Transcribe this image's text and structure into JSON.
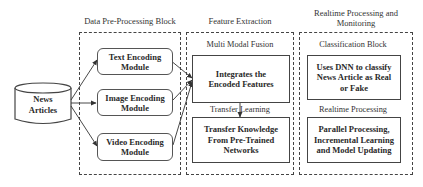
{
  "diagram": {
    "source": {
      "label_line1": "News",
      "label_line2": "Articles",
      "shape": "database-cylinder"
    },
    "blocks": [
      {
        "id": "data-preprocessing",
        "title": "Data Pre-Processing Block",
        "modules": [
          {
            "line1": "Text Encoding",
            "line2": "Module"
          },
          {
            "line1": "Image Encoding",
            "line2": "Module"
          },
          {
            "line1": "Video Encoding",
            "line2": "Module"
          }
        ]
      },
      {
        "id": "feature-extraction",
        "title": "Feature Extraction",
        "sections": [
          {
            "title": "Multi Modal Fusion",
            "box_line1": "Integrates the",
            "box_line2": "Encoded Features"
          },
          {
            "title": "Transfer Learning",
            "box_line1": "Transfer Knowledge",
            "box_line2": "From Pre-Trained",
            "box_line3": "Networks"
          }
        ]
      },
      {
        "id": "realtime-processing",
        "title_line1": "Realtime Processing and",
        "title_line2": "Monitoring",
        "sections": [
          {
            "title": "Classification Block",
            "box_line1": "Uses DNN to classify",
            "box_line2": "News Article as Real",
            "box_line3": "or Fake"
          },
          {
            "title": "Realtime Processing",
            "box_line1": "Parallel Processing,",
            "box_line2": "Incremental Learning",
            "box_line3": "and Model Updating"
          }
        ]
      }
    ],
    "connections": [
      {
        "from": "News Articles",
        "to": "Text Encoding Module"
      },
      {
        "from": "News Articles",
        "to": "Image Encoding Module"
      },
      {
        "from": "News Articles",
        "to": "Video Encoding Module"
      },
      {
        "from": "Text Encoding Module",
        "to": "Integrates the Encoded Features"
      },
      {
        "from": "Image Encoding Module",
        "to": "Integrates the Encoded Features"
      },
      {
        "from": "Video Encoding Module",
        "to": "Integrates the Encoded Features"
      },
      {
        "from": "Integrates the Encoded Features",
        "to": "Transfer Knowledge From Pre-Trained Networks"
      }
    ],
    "colors": {
      "line": "#444444",
      "text": "#2a2a2a",
      "background": "#ffffff"
    }
  }
}
